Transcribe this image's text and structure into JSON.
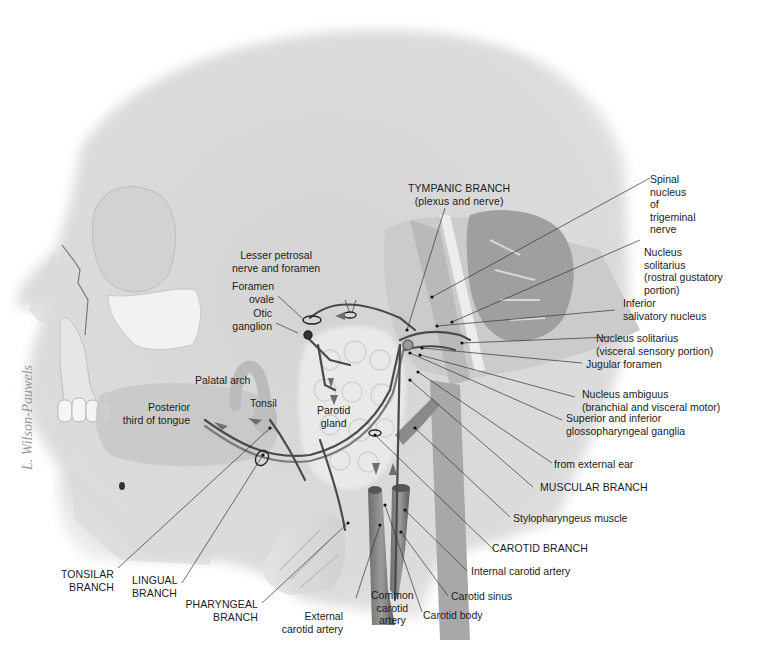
{
  "figure": {
    "signature": "L. Wilson-Pauwels",
    "colors": {
      "background": "#ffffff",
      "skin": "#d9d9d9",
      "bone": "#ececec",
      "brainstem": "#b5b5b5",
      "cerebellum": "#9d9d9d",
      "nerve": "#444444",
      "label_text": "#1c1c1c",
      "leader_line": "#333333"
    }
  },
  "labels": {
    "tympanic_branch": "TYMPANIC BRANCH",
    "tympanic_branch_sub": "(plexus and nerve)",
    "spinal_nucleus": [
      "Spinal",
      "nucleus",
      "of",
      "trigeminal",
      "nerve"
    ],
    "nucleus_solitarius_rostral": [
      "Nucleus",
      "solitarius",
      "(rostral gustatory",
      "portion)"
    ],
    "inferior_salivatory": [
      "Inferior",
      "salivatory nucleus"
    ],
    "nucleus_solitarius_visceral": [
      "Nucleus solitarius",
      "(visceral sensory portion)"
    ],
    "jugular_foramen": "Jugular foramen",
    "nucleus_ambiguus": [
      "Nucleus ambiguus",
      "(branchial and visceral motor)"
    ],
    "ganglia": [
      "Superior and inferior",
      "glossopharyngeal ganglia"
    ],
    "from_external_ear": "from external ear",
    "muscular_branch": "MUSCULAR BRANCH",
    "stylopharyngeus": "Stylopharyngeus muscle",
    "carotid_branch": "CAROTID BRANCH",
    "internal_carotid": "Internal carotid artery",
    "carotid_sinus": "Carotid sinus",
    "carotid_body": "Carotid body",
    "common_carotid": [
      "Common",
      "carotid",
      "artery"
    ],
    "external_carotid": [
      "External",
      "carotid artery"
    ],
    "pharyngeal_branch": [
      "PHARYNGEAL",
      "BRANCH"
    ],
    "lingual_branch": [
      "LINGUAL",
      "BRANCH"
    ],
    "tonsilar_branch": [
      "TONSILAR",
      "BRANCH"
    ],
    "lesser_petrosal": [
      "Lesser petrosal",
      "nerve and foramen"
    ],
    "foramen_ovale": [
      "Foramen",
      "ovale"
    ],
    "otic_ganglion": [
      "Otic",
      "ganglion"
    ],
    "palatal_arch": "Palatal arch",
    "tonsil": "Tonsil",
    "posterior_tongue": [
      "Posterior",
      "third of tongue"
    ],
    "parotid_gland": [
      "Parotid",
      "gland"
    ]
  }
}
